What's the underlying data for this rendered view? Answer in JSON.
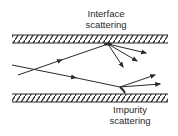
{
  "diagram": {
    "labels": {
      "interface_line1": "Interface",
      "interface_line2": "scattering",
      "impurity_line1": "Impurity",
      "impurity_line2": "scattering"
    },
    "colors": {
      "ink": "#2a2a2a",
      "background": "#ffffff"
    },
    "walls": [
      {
        "name": "top-wall",
        "x1": 12,
        "x2": 168,
        "y_top": 35,
        "y_bottom": 43
      },
      {
        "name": "bottom-wall",
        "x1": 12,
        "x2": 168,
        "y_top": 94,
        "y_bottom": 102
      }
    ],
    "trajectories": [
      {
        "name": "incident-ray-to-interface",
        "from": [
          18,
          75
        ],
        "to": [
          108,
          44
        ]
      },
      {
        "name": "incident-ray-to-impurity",
        "from": [
          12,
          65
        ],
        "to": [
          120,
          87
        ]
      }
    ],
    "scattered_rays": {
      "interface": [
        [
          146,
          53
        ],
        [
          137,
          61
        ],
        [
          123,
          67
        ]
      ],
      "impurity": [
        [
          155,
          75
        ],
        [
          160,
          84
        ]
      ]
    }
  }
}
